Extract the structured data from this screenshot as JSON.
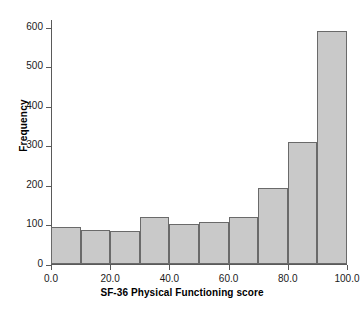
{
  "chart_data": {
    "type": "bar",
    "title": "",
    "xlabel": "SF-36 Physical Functioning score",
    "ylabel": "Frequency",
    "categories": [
      "0-10",
      "10-20",
      "20-30",
      "30-40",
      "40-50",
      "50-60",
      "60-70",
      "70-80",
      "80-90",
      "90-100"
    ],
    "bin_edges": [
      0,
      10,
      20,
      30,
      40,
      50,
      60,
      70,
      80,
      90,
      100
    ],
    "values": [
      93,
      85,
      84,
      120,
      101,
      107,
      120,
      193,
      310,
      590
    ],
    "xlim": [
      0,
      100
    ],
    "ylim": [
      0,
      620
    ],
    "xticks": [
      0,
      20,
      40,
      60,
      80,
      100
    ],
    "xtick_labels": [
      "0.0",
      "20.0",
      "40.0",
      "60.0",
      "80.0",
      "100.0"
    ],
    "yticks": [
      0,
      100,
      200,
      300,
      400,
      500,
      600
    ],
    "ytick_labels": [
      "0",
      "100",
      "200",
      "300",
      "400",
      "500",
      "600"
    ],
    "grid": false,
    "legend": null,
    "bar_fill_color": "#c9c9c9",
    "bar_border_color": "#6a6a6a",
    "axis_color": "#5a5a5a"
  }
}
